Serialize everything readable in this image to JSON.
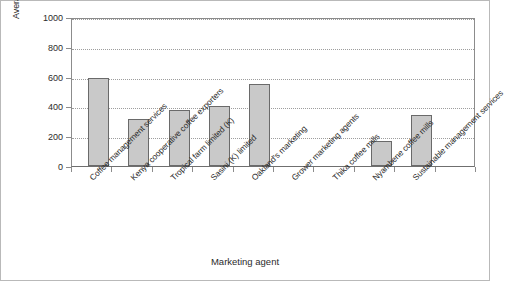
{
  "chart_data": {
    "type": "bar",
    "title": "",
    "xlabel": "Marketing agent",
    "ylabel": "Average price/50 kg bag (USD)",
    "ylim": [
      0,
      1000
    ],
    "yticks": [
      0,
      200,
      400,
      600,
      800,
      1000
    ],
    "grid": true,
    "legend": false,
    "bar_color": "#c9c9c9",
    "bar_edge_color": "#6a6a6a",
    "categories": [
      "Coffee management services",
      "Kenya cooperative coffee exporters",
      "Tropical farm limited (K)",
      "Sasini (K) limited",
      "Oakland's marketing",
      "Grower marketing agents",
      "Thika coffee mills",
      "Nyambene coffee mills",
      "Sustainable management services"
    ],
    "values": [
      590,
      315,
      375,
      405,
      550,
      0,
      0,
      165,
      340
    ],
    "bars": [
      {
        "label": "Coffee management services",
        "value": 590
      },
      {
        "label": "Kenya cooperative coffee exporters",
        "value": 315
      },
      {
        "label": "Tropical farm limited (K)",
        "value": 375
      },
      {
        "label": "Sasini (K) limited",
        "value": 405
      },
      {
        "label": "Oakland's marketing",
        "value": 550
      },
      {
        "label": "Grower marketing agents",
        "value": 0
      },
      {
        "label": "Thika coffee mills",
        "value": 0
      },
      {
        "label": "Nyambene coffee mills",
        "value": 165
      },
      {
        "label": "Sustainable management services",
        "value": 340
      }
    ]
  }
}
